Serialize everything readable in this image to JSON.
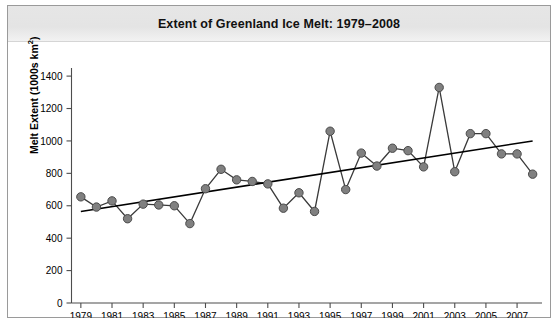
{
  "chart_data": {
    "type": "line",
    "title": "Extent of Greenland Ice Melt: 1979–2008",
    "xlabel": "",
    "ylabel": "Melt Extent (1000s km²)",
    "ylabel_main": "Melt Extent (1000s km",
    "ylabel_sup": "2",
    "ylabel_end": ")",
    "xlim": [
      1978.4,
      2008.6
    ],
    "ylim": [
      0,
      1450
    ],
    "grid": false,
    "legend": "none",
    "yticks": [
      0,
      200,
      400,
      600,
      800,
      1000,
      1200,
      1400
    ],
    "ytick_labels": [
      "0",
      "200",
      "400",
      "600",
      "800",
      "1000",
      "1200",
      "1400"
    ],
    "xticks": [
      1979,
      1981,
      1983,
      1985,
      1987,
      1989,
      1991,
      1993,
      1995,
      1997,
      1999,
      2001,
      2003,
      2005,
      2007
    ],
    "xtick_labels": [
      "1979",
      "1981",
      "1983",
      "1985",
      "1987",
      "1989",
      "1991",
      "1993",
      "1995",
      "1997",
      "1999",
      "2001",
      "2003",
      "2005",
      "2007"
    ],
    "x": [
      1979,
      1980,
      1981,
      1982,
      1983,
      1984,
      1985,
      1986,
      1987,
      1988,
      1989,
      1990,
      1991,
      1992,
      1993,
      1994,
      1995,
      1996,
      1997,
      1998,
      1999,
      2000,
      2001,
      2002,
      2003,
      2004,
      2005,
      2006,
      2007,
      2008
    ],
    "values": [
      655,
      592,
      630,
      520,
      610,
      605,
      600,
      490,
      705,
      825,
      760,
      750,
      735,
      585,
      680,
      565,
      1060,
      700,
      925,
      845,
      955,
      940,
      840,
      1330,
      810,
      1045,
      1045,
      920,
      920,
      795
    ],
    "series": [
      {
        "name": "Melt extent",
        "marker": "filled-circle",
        "color": "#808080",
        "line_color": "#3a3a3a",
        "values": [
          655,
          592,
          630,
          520,
          610,
          605,
          600,
          490,
          705,
          825,
          760,
          750,
          735,
          585,
          680,
          565,
          1060,
          700,
          925,
          845,
          955,
          940,
          840,
          1330,
          810,
          1045,
          1045,
          920,
          920,
          795
        ]
      },
      {
        "name": "Linear trend",
        "marker": "none",
        "color": "#000000",
        "endpoints": [
          [
            1979,
            565
          ],
          [
            2008,
            1000
          ]
        ]
      }
    ],
    "annotations": []
  },
  "figure": {
    "title": "Extent of Greenland Ice Melt: 1979–2008",
    "border_color": "#9a9a9a",
    "title_band_color": "#e5e5e5",
    "plot_background": "#ffffff",
    "marker_color": "#808080",
    "line_color": "#3a3a3a",
    "trend_color": "#000000",
    "axis_color": "#4d4d4d"
  }
}
